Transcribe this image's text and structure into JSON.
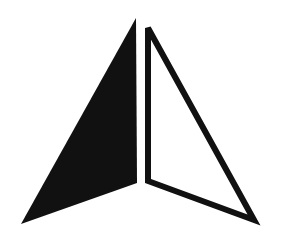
{
  "figure": {
    "background": "#ffffff",
    "shapes": [
      {
        "name": "left-filled-triangle",
        "fill": "#111111",
        "stroke": "none",
        "points": "136,18 137,183 21,224"
      },
      {
        "name": "right-outlined-triangle",
        "fill": "#ffffff",
        "stroke": "#111111",
        "stroke_width": 6,
        "points": "148,28 148,181 254,220"
      }
    ]
  }
}
